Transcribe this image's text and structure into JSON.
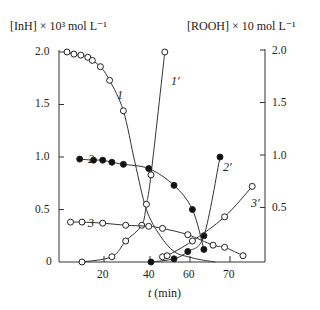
{
  "chart_data": {
    "type": "line",
    "title": "",
    "xlabel": "t (min)",
    "ylabel_left": "[InH] × 10³ mol L⁻¹",
    "ylabel_right": "[ROOH] × 10 mol L⁻¹",
    "x_ticks": [
      "20",
      "40",
      "60",
      "70"
    ],
    "y_ticks_left": [
      "0",
      "0.5",
      "1.0",
      "1.5",
      "2.0"
    ],
    "y_ticks_right": [
      "0.5",
      "1.0",
      "1.5",
      "2.0"
    ],
    "ylim": [
      0,
      2.0
    ],
    "grid": false,
    "series": [
      {
        "name": "1",
        "axis": "left",
        "marker": "open",
        "x": [
          3.5,
          6.5,
          9.5,
          12.5,
          14.5,
          18,
          22,
          28
        ],
        "y": [
          2.0,
          1.98,
          1.97,
          1.95,
          1.92,
          1.86,
          1.73,
          1.44
        ],
        "tail_x": [
          33,
          38,
          44,
          50,
          56,
          62,
          68
        ],
        "tail_y": [
          0.95,
          0.5,
          0.25,
          0.1,
          0.05,
          0.02,
          0.0
        ]
      },
      {
        "name": "1'",
        "axis": "right",
        "marker": "open",
        "x": [
          10,
          23,
          29,
          36,
          38,
          40,
          46
        ],
        "y": [
          0.0,
          0.05,
          0.2,
          0.35,
          0.55,
          0.83,
          2.0
        ]
      },
      {
        "name": "2",
        "axis": "left",
        "marker": "filled",
        "x": [
          9,
          15,
          19,
          23,
          28,
          39,
          50,
          58,
          63
        ],
        "y": [
          0.98,
          0.97,
          0.97,
          0.95,
          0.93,
          0.89,
          0.73,
          0.5,
          0.12
        ]
      },
      {
        "name": "2'",
        "axis": "right",
        "marker": "filled",
        "x": [
          40,
          50,
          56,
          63,
          70
        ],
        "y": [
          0.0,
          0.03,
          0.1,
          0.25,
          1.0
        ]
      },
      {
        "name": "3",
        "axis": "left",
        "marker": "open",
        "x": [
          5,
          10,
          19,
          29,
          39,
          45,
          56,
          67,
          72,
          80
        ],
        "y": [
          0.38,
          0.38,
          0.37,
          0.35,
          0.34,
          0.32,
          0.26,
          0.16,
          0.14,
          0.06
        ]
      },
      {
        "name": "3'",
        "axis": "right",
        "marker": "open",
        "x": [
          45,
          47,
          58,
          72,
          84
        ],
        "y": [
          0.05,
          0.06,
          0.2,
          0.43,
          0.72
        ]
      }
    ],
    "curve_labels": [
      {
        "text": "1",
        "x": 117,
        "y": 88
      },
      {
        "text": "1′",
        "x": 171,
        "y": 74
      },
      {
        "text": "2",
        "x": 88,
        "y": 152
      },
      {
        "text": "2′",
        "x": 223,
        "y": 160
      },
      {
        "text": "3",
        "x": 88,
        "y": 216
      },
      {
        "text": "3′",
        "x": 251,
        "y": 196
      }
    ]
  }
}
